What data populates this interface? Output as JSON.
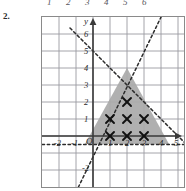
{
  "figure": {
    "problem_number": "2.",
    "cut_off_top_labels": [
      "1",
      "2",
      "3",
      "4",
      "5",
      "6"
    ],
    "axis_letter_x": "x",
    "axis_letter_y": "y",
    "origin_label": "O"
  },
  "chart_data": {
    "type": "scatter",
    "title": "",
    "xlabel": "x",
    "ylabel": "y",
    "xlim": [
      -3,
      7
    ],
    "ylim": [
      -3,
      7
    ],
    "grid": true,
    "legend": "none",
    "x_tick_labels": [
      "-2",
      "-1",
      "1",
      "2",
      "3",
      "4",
      "5",
      "6"
    ],
    "x_tick_values": [
      -2,
      -1,
      1,
      2,
      3,
      4,
      5,
      6
    ],
    "y_tick_labels": [
      "6",
      "5",
      "4",
      "3",
      "2",
      "1",
      "-2"
    ],
    "y_tick_values": [
      6,
      5,
      4,
      3,
      2,
      1,
      -2
    ],
    "boundary_lines": [
      {
        "name": "descending-dashed-line",
        "style": "dashed",
        "points": [
          [
            -1,
            6
          ],
          [
            6,
            -1
          ]
        ],
        "note": "falls left-to-right through apex"
      },
      {
        "name": "ascending-dashed-line",
        "style": "dashed",
        "points": [
          [
            -1,
            -3
          ],
          [
            4,
            7
          ]
        ],
        "note": "rises steeply through apex"
      },
      {
        "name": "horizontal-dashed-line",
        "style": "dashed",
        "points": [
          [
            -3,
            -0.5
          ],
          [
            7,
            -0.5
          ]
        ],
        "note": "lower boundary of shaded region"
      }
    ],
    "shaded_region": {
      "name": "feasible-triangle",
      "fill": "#a8a8a8",
      "vertices": [
        [
          2,
          3
        ],
        [
          4.45,
          -0.5
        ],
        [
          -0.45,
          -0.5
        ]
      ]
    },
    "marked_points": {
      "marker": "x",
      "points": [
        [
          2,
          2
        ],
        [
          1,
          1
        ],
        [
          2,
          1
        ],
        [
          3,
          1
        ],
        [
          1,
          0
        ],
        [
          2,
          0
        ],
        [
          3,
          0
        ]
      ]
    },
    "colors": {
      "grid": "#9a9aa0",
      "axis": "#3a3a3a",
      "dashed": "#2b2b2b",
      "shade": "#a8a8a8",
      "marker": "#111111"
    }
  }
}
